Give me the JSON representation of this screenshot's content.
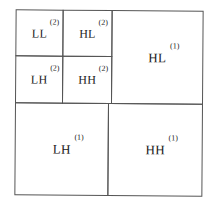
{
  "diagram": {
    "title": "",
    "type": "wavelet-subband-decomposition",
    "levels": 2,
    "subbands": [
      {
        "id": "ll2",
        "name": "LL",
        "level": "(2)"
      },
      {
        "id": "hl2",
        "name": "HL",
        "level": "(2)"
      },
      {
        "id": "lh2",
        "name": "LH",
        "level": "(2)"
      },
      {
        "id": "hh2",
        "name": "HH",
        "level": "(2)"
      },
      {
        "id": "hl1",
        "name": "HL",
        "level": "(1)"
      },
      {
        "id": "lh1",
        "name": "LH",
        "level": "(1)"
      },
      {
        "id": "hh1",
        "name": "HH",
        "level": "(1)"
      }
    ],
    "colors": {
      "line": "#555555",
      "text": "#222222",
      "background": "#ffffff"
    }
  }
}
